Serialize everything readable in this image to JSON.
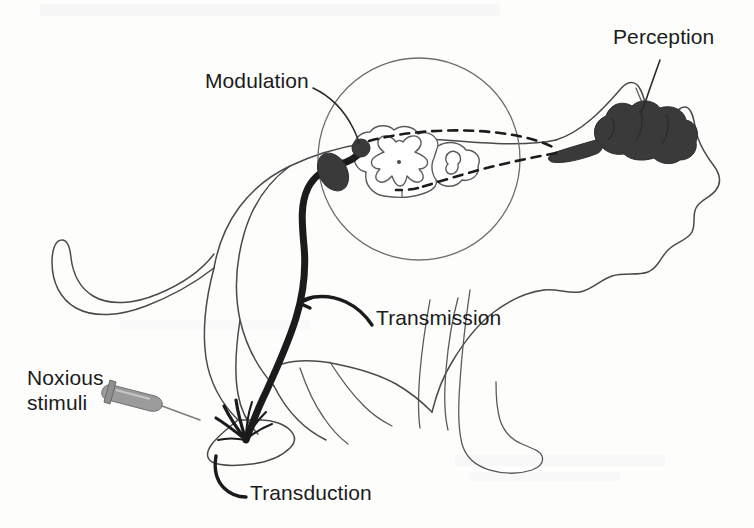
{
  "figure": {
    "background_color": "#fdfdfc",
    "line_color": "#4a4a4a",
    "nerve_color": "#1b1b1b",
    "accent_gray": "#9b9b9b"
  },
  "labels": {
    "modulation": "Modulation",
    "perception": "Perception",
    "transmission": "Transmission",
    "transduction": "Transduction",
    "noxious_line1": "Noxious",
    "noxious_line2": "stimuli"
  },
  "icons": {
    "syringe": "syringe-icon",
    "magnifier": "magnifier-circle-icon",
    "brain": "brain-icon",
    "spinal_cord": "spinal-cord-cross-section-icon",
    "dorsal_root_ganglion": "dorsal-root-ganglion-icon",
    "cat": "cat-outline-icon"
  },
  "ghost_text": {
    "top": "",
    "bottom": ""
  }
}
